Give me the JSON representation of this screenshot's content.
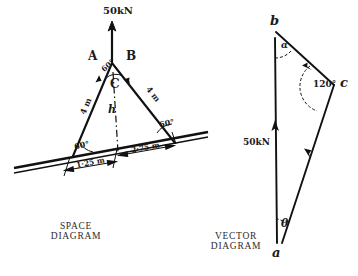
{
  "figure": {
    "panels": [
      {
        "id": "space-diagram",
        "caption_line1": "SPACE",
        "caption_line2": "DIAGRAM",
        "load_label": "50kN",
        "joints": {
          "left_member": "A",
          "right_member": "B",
          "apex_node": "C"
        },
        "height_label": "h",
        "member_lengths": {
          "left": "4 m",
          "right": "4 m"
        },
        "angles": {
          "apex": "60°",
          "base_left": "60°",
          "base_right": "60°"
        },
        "dimensions": {
          "left_span": "1·25 m",
          "right_span": "2·75 m"
        }
      },
      {
        "id": "vector-diagram",
        "caption_line1": "VECTOR",
        "caption_line2": "DIAGRAM",
        "vertices": {
          "top": "b",
          "right": "c",
          "bottom": "a"
        },
        "load_label": "50kN",
        "angles": {
          "at_b": "α",
          "at_c": "120°",
          "at_a": "θ"
        }
      }
    ],
    "colors": {
      "ink": "#111111",
      "caption": "#2b2b2b",
      "paper": "#ffffff"
    }
  }
}
